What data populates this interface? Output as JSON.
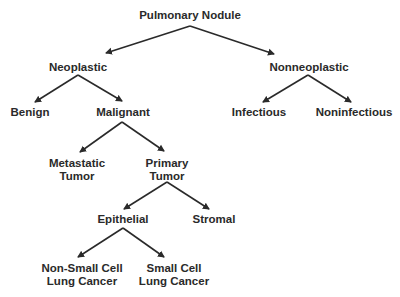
{
  "diagram": {
    "type": "tree",
    "colors": {
      "text": "#2a2a2a",
      "line": "#2a2a2a",
      "background": "#ffffff"
    },
    "nodes": {
      "root": {
        "line1": "Pulmonary Nodule"
      },
      "neoplastic": {
        "line1": "Neoplastic"
      },
      "nonneoplastic": {
        "line1": "Nonneoplastic"
      },
      "benign": {
        "line1": "Benign"
      },
      "malignant": {
        "line1": "Malignant"
      },
      "infectious": {
        "line1": "Infectious"
      },
      "noninfectious": {
        "line1": "Noninfectious"
      },
      "metastatic": {
        "line1": "Metastatic",
        "line2": "Tumor"
      },
      "primary": {
        "line1": "Primary",
        "line2": "Tumor"
      },
      "epithelial": {
        "line1": "Epithelial"
      },
      "stromal": {
        "line1": "Stromal"
      },
      "nsclc": {
        "line1": "Non-Small Cell",
        "line2": "Lung Cancer"
      },
      "sclc": {
        "line1": "Small Cell",
        "line2": "Lung Cancer"
      }
    },
    "edges": [
      [
        "Pulmonary Nodule",
        "Neoplastic"
      ],
      [
        "Pulmonary Nodule",
        "Nonneoplastic"
      ],
      [
        "Neoplastic",
        "Benign"
      ],
      [
        "Neoplastic",
        "Malignant"
      ],
      [
        "Nonneoplastic",
        "Infectious"
      ],
      [
        "Nonneoplastic",
        "Noninfectious"
      ],
      [
        "Malignant",
        "Metastatic Tumor"
      ],
      [
        "Malignant",
        "Primary Tumor"
      ],
      [
        "Primary Tumor",
        "Epithelial"
      ],
      [
        "Primary Tumor",
        "Stromal"
      ],
      [
        "Epithelial",
        "Non-Small Cell Lung Cancer"
      ],
      [
        "Epithelial",
        "Small Cell Lung Cancer"
      ]
    ]
  }
}
